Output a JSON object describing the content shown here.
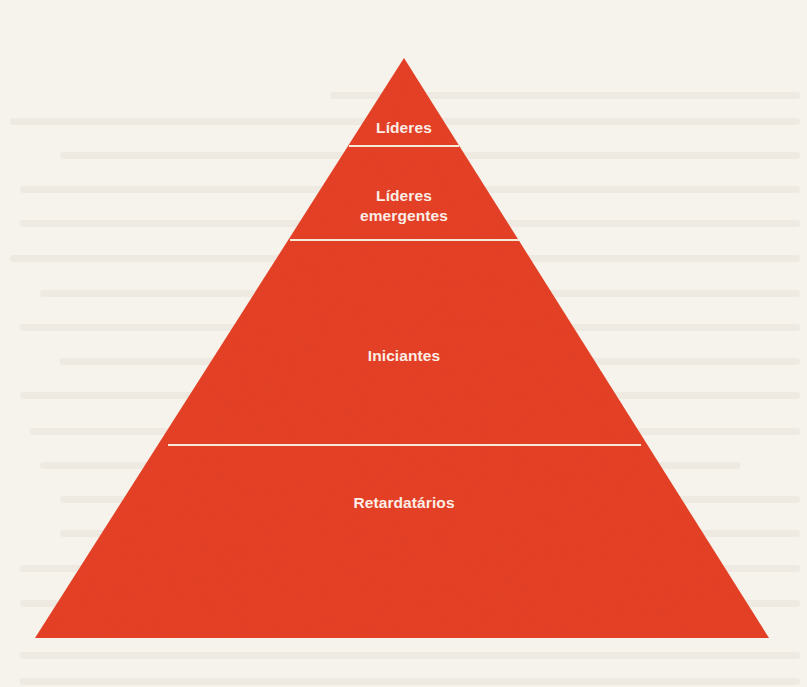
{
  "diagram": {
    "type": "pyramid",
    "fill_color": "#e8432a",
    "divider_color": "#f6ead8",
    "background_color": "#f6f3ec",
    "label_color": "#fbeee6",
    "tiers": [
      {
        "label": "Líderes",
        "order": 1
      },
      {
        "label": "Líderes\nemergentes",
        "order": 2
      },
      {
        "label": "Iniciantes",
        "order": 3
      },
      {
        "label": "Retardatários",
        "order": 4
      }
    ]
  }
}
